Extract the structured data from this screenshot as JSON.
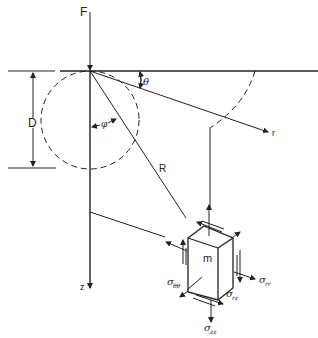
{
  "diagram": {
    "labels": {
      "force": "F",
      "depth": "D",
      "theta": "θ",
      "phi": "φ",
      "radial_axis": "r",
      "radius": "R",
      "depth_axis": "z",
      "element": "m"
    },
    "stresses": {
      "sigma_rr": {
        "symbol": "σ",
        "sub": "rr"
      },
      "sigma_theta_theta": {
        "symbol": "σ",
        "sub": "θθ"
      },
      "sigma_rz": {
        "symbol": "σ",
        "sub": "rz"
      },
      "sigma_zz": {
        "symbol": "σ",
        "sub": "zz"
      }
    },
    "colors": {
      "line": "#222222",
      "background": "#ffffff"
    }
  }
}
